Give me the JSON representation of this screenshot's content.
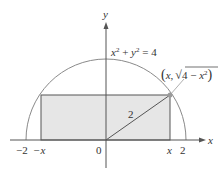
{
  "figure": {
    "equation_label": {
      "x": "x",
      "sup1": "2",
      "plus": " + ",
      "y": "y",
      "sup2": "2",
      "eq": " = 4"
    },
    "point_label": {
      "open": "(",
      "x": "x",
      "comma": ",",
      "sqrt": "√",
      "inner": "4 − ",
      "x2": "x",
      "sup": "2",
      "close": ")"
    },
    "axis_x_label": "x",
    "axis_y_label": "y",
    "radius_label": "2",
    "tick_labels": {
      "neg_two": "−2",
      "neg_x": "−x",
      "origin": "0",
      "pos_x": "x",
      "pos_two": "2"
    },
    "colors": {
      "circle": "#8a8a8a",
      "rect_fill": "#e6e6e6",
      "rect_stroke": "#555555",
      "axis": "#555555",
      "point": "#9a9a9a",
      "text": "#333333"
    }
  }
}
